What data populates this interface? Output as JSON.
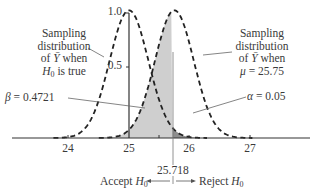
{
  "chart_data": {
    "type": "line",
    "title": "",
    "xlabel": "",
    "ylabel": "",
    "x_ticks": [
      24,
      25,
      26,
      27
    ],
    "y_ticks": [
      0.5,
      1.0
    ],
    "xlim": [
      23.1,
      28.0
    ],
    "ylim": [
      0,
      1.0
    ],
    "grid": false,
    "series": [
      {
        "name": "Sampling distribution of Ȳ when H0 is true",
        "mean": 25.0,
        "peak": 0.9,
        "style": "dashed"
      },
      {
        "name": "Sampling distribution of Ȳ when μ = 25.75",
        "mean": 25.75,
        "peak": 0.9,
        "style": "dashed"
      }
    ],
    "shaded_regions": [
      {
        "name": "beta",
        "label": "β = 0.4721",
        "from": 23.1,
        "to": 25.718,
        "under": "μ = 25.75 curve",
        "color": "#cfcfcf"
      },
      {
        "name": "alpha",
        "label": "α = 0.05",
        "from": 25.718,
        "to": 28.0,
        "under": "H0 curve",
        "color": "#8e8e8e"
      }
    ],
    "critical_value": 25.718,
    "annotations": [
      "β = 0.4721",
      "α = 0.05",
      "25.718",
      "Accept H0",
      "Reject H0"
    ]
  },
  "labels": {
    "left_curve": {
      "line1": "Sampling",
      "line2": "distribution",
      "line3_pre": "of ",
      "line3_var": "Ȳ",
      "line3_post": " when",
      "line4_var": "H",
      "line4_sub": "0",
      "line4_post": " is true"
    },
    "right_curve": {
      "line1": "Sampling",
      "line2": "distribution",
      "line3_pre": "of ",
      "line3_var": "Ȳ",
      "line3_post": " when",
      "line4_var": "μ",
      "line4_post": " = 25.75"
    },
    "beta": {
      "sym": "β",
      "text": " = 0.4721"
    },
    "alpha": {
      "sym": "α",
      "text": " = 0.05"
    },
    "critical": "25.718",
    "accept": {
      "text": "Accept ",
      "var": "H",
      "sub": "0"
    },
    "reject": {
      "text": "Reject ",
      "var": "H",
      "sub": "0"
    },
    "y_ticks": {
      "t1": "1.0",
      "t05": "0.5"
    },
    "x_ticks": {
      "t24": "24",
      "t25": "25",
      "t26": "26",
      "t27": "27"
    }
  }
}
